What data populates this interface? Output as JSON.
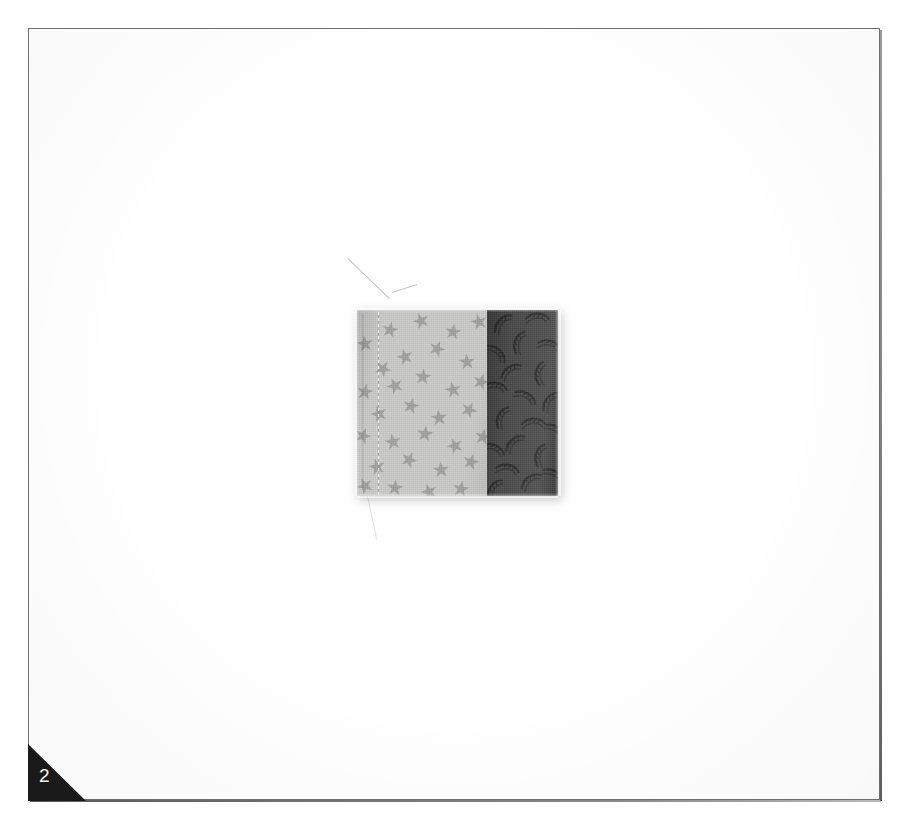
{
  "page": {
    "width": 899,
    "height": 828,
    "background_color": "#ffffff",
    "kind": "scanned-fabric-swatch-card",
    "page_number": "2"
  },
  "frame": {
    "name": "card-border",
    "line_color": "#6e6e6e",
    "fill_color": "#fefefe",
    "left": 28,
    "top": 28,
    "width": 852,
    "height": 772
  },
  "corner_tab": {
    "shape": "right-triangle",
    "fill_color": "#1a1a1a",
    "label": "2",
    "label_color": "#ffffff",
    "position": "bottom-left"
  },
  "swatch": {
    "name": "two-panel-fabric-sample",
    "left": 357,
    "top": 310,
    "width": 201,
    "height": 186,
    "panels": [
      {
        "name": "light-star-print",
        "base_color": "#cbcbc9",
        "motif": "five-pointed-stars",
        "motif_color": "#9a9a9a",
        "width_px": 130,
        "has_stitched_seam": true
      },
      {
        "name": "dark-crescent-print",
        "base_color": "#4b4b4b",
        "motif": "crescent-paisley-sprigs",
        "motif_color": "#2e2e2e",
        "width_px": 71,
        "has_stitched_seam": false
      }
    ],
    "seam_position_px": 130,
    "shadow_color": "rgba(0,0,0,0.22)"
  },
  "artifacts": {
    "loose_threads": 3,
    "scanner_streaks": 4,
    "speckle_opacity": "0.015"
  }
}
